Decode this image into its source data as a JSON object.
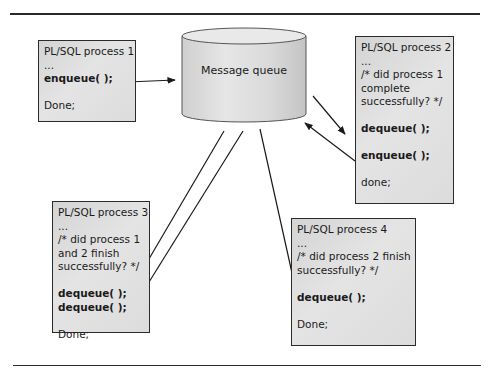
{
  "diagram": {
    "queue": {
      "label": "Message queue"
    },
    "processes": [
      {
        "id": "process-1",
        "title": "PL/SQL process 1",
        "lines": [
          "...",
          "enqueue( );",
          "",
          "Done;"
        ],
        "bold": [
          false,
          true,
          false,
          false
        ]
      },
      {
        "id": "process-2",
        "title": "PL/SQL process 2",
        "lines": [
          "...",
          "/* did process 1",
          "complete",
          "successfully? */",
          "",
          "dequeue( );",
          "",
          "enqueue( );",
          "",
          "done;"
        ],
        "bold": [
          false,
          false,
          false,
          false,
          false,
          true,
          false,
          true,
          false,
          false
        ]
      },
      {
        "id": "process-3",
        "title": "PL/SQL process 3",
        "lines": [
          "...",
          "/* did process 1",
          "and 2 finish",
          "successfully? */",
          "",
          "dequeue( );",
          "dequeue( );",
          "",
          "Done;"
        ],
        "bold": [
          false,
          false,
          false,
          false,
          false,
          true,
          true,
          false,
          false
        ]
      },
      {
        "id": "process-4",
        "title": "PL/SQL process 4",
        "lines": [
          "...",
          "/* did process 2 finish",
          "successfully? */",
          "",
          "dequeue( );",
          "",
          "Done;"
        ],
        "bold": [
          false,
          false,
          false,
          false,
          true,
          false,
          false
        ]
      }
    ],
    "connections": [
      {
        "from": "process-1",
        "to": "queue",
        "label": "enqueue"
      },
      {
        "from": "queue",
        "to": "process-2",
        "label": "dequeue"
      },
      {
        "from": "process-2",
        "to": "queue",
        "label": "enqueue"
      },
      {
        "from": "queue",
        "to": "process-3",
        "label": "dequeue"
      },
      {
        "from": "queue",
        "to": "process-3",
        "label": "dequeue"
      },
      {
        "from": "queue",
        "to": "process-4",
        "label": "dequeue"
      }
    ]
  }
}
